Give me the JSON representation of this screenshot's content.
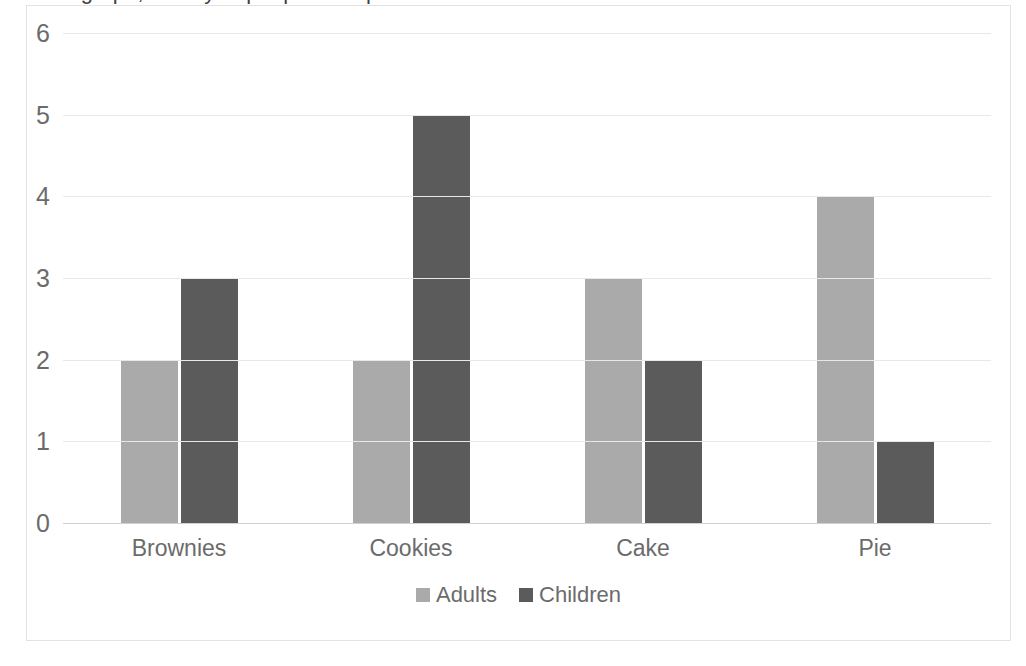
{
  "chart_data": {
    "type": "bar",
    "title": "Bar graph, survey of people who prefer brownies and cake.",
    "xlabel": "",
    "ylabel": "",
    "categories": [
      "Brownies",
      "Cookies",
      "Cake",
      "Pie"
    ],
    "series": [
      {
        "name": "Adults",
        "color": "#aaaaaa",
        "values": [
          2,
          2,
          3,
          4
        ]
      },
      {
        "name": "Children",
        "color": "#5b5b5b",
        "values": [
          3,
          5,
          2,
          1
        ]
      }
    ],
    "ylim": [
      0,
      6
    ],
    "yticks": [
      6,
      5,
      4,
      3,
      2,
      1,
      0
    ],
    "grid": true,
    "legend_position": "bottom",
    "gridline_color": "#e8e8e8",
    "frame_color": "#e3e3e3",
    "text_color": "#6b6b6b"
  }
}
